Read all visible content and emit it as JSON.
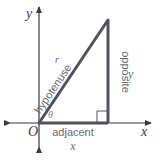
{
  "diagram": {
    "axes": {
      "x_label": "x",
      "y_label": "y",
      "origin_label": "O"
    },
    "triangle": {
      "hypotenuse_label": "hypotenuse",
      "hypotenuse_variable": "r",
      "opposite_label": "opposite",
      "opposite_variable": "y",
      "adjacent_label": "adjacent",
      "adjacent_variable": "x",
      "angle_label": "θ",
      "right_angle_marker": true
    },
    "colors": {
      "stroke": "#4a4a55",
      "axis": "#3a3a40",
      "label": "#6b6b72"
    }
  }
}
